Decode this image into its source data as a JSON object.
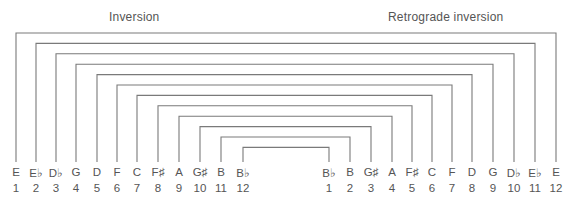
{
  "titles": {
    "left": "Inversion",
    "right": "Retrograde inversion"
  },
  "line_color": "#7a7a7a",
  "inversion": {
    "notes": [
      "E",
      "E♭",
      "D♭",
      "G",
      "D",
      "F",
      "C",
      "F♯",
      "A",
      "G♯",
      "B",
      "B♭"
    ],
    "numbers": [
      "1",
      "2",
      "3",
      "4",
      "5",
      "6",
      "7",
      "8",
      "9",
      "10",
      "11",
      "12"
    ],
    "x": [
      16,
      36,
      56,
      76,
      97,
      117,
      137,
      158,
      179,
      200,
      221,
      243
    ]
  },
  "retrograde_inversion": {
    "notes": [
      "B♭",
      "B",
      "G♯",
      "A",
      "F♯",
      "C",
      "F",
      "D",
      "G",
      "D♭",
      "E♭",
      "E"
    ],
    "numbers": [
      "1",
      "2",
      "3",
      "4",
      "5",
      "6",
      "7",
      "8",
      "9",
      "10",
      "11",
      "12"
    ],
    "x": [
      329,
      350,
      371,
      392,
      412,
      432,
      452,
      472,
      493,
      514,
      535,
      556
    ]
  },
  "brackets": {
    "description": "Nested brackets connect note n of Inversion with the same pitch in Retrograde inversion (position 13-n)",
    "top_y_start": 33,
    "top_y_step": 10.4,
    "bottom_y": 162
  }
}
